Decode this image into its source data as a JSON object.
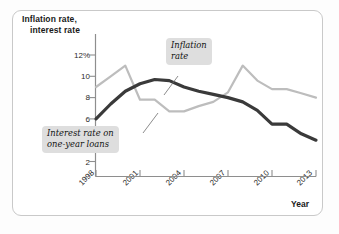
{
  "figure": {
    "type": "line-chart-figure",
    "background": "#ffffff",
    "border_color": "#c9c9c9"
  },
  "axes": {
    "y_title_line1": "Inflation rate,",
    "y_title_line2": "interest rate",
    "x_title": "Year",
    "y_ticks": [
      "12%",
      "10",
      "8",
      "6",
      "4",
      "2"
    ],
    "x_ticks": [
      "1998",
      "2001",
      "2004",
      "2007",
      "2010",
      "2013"
    ]
  },
  "callouts": [
    {
      "name": "inflation-rate-callout",
      "line1": "Inflation",
      "line2": "rate",
      "bg": "#dedede"
    },
    {
      "name": "interest-rate-callout",
      "line1": "Interest rate on",
      "line2": "one-year loans",
      "bg": "#dedede"
    }
  ],
  "chart_data": {
    "type": "line",
    "title": "",
    "xlabel": "Year",
    "ylabel": "Inflation rate, interest rate",
    "xlim": [
      1998,
      2013
    ],
    "ylim": [
      0,
      13
    ],
    "ytick_values": [
      2,
      4,
      6,
      8,
      10,
      12
    ],
    "ytick_labels": [
      "2",
      "4",
      "6",
      "8",
      "10",
      "12%"
    ],
    "xtick_values": [
      1998,
      2001,
      2004,
      2007,
      2010,
      2013
    ],
    "xtick_labels": [
      "1998",
      "2001",
      "2004",
      "2007",
      "2010",
      "2013"
    ],
    "grid": false,
    "legend": "callout-annotations",
    "x": [
      1998,
      1999,
      2000,
      2001,
      2002,
      2003,
      2004,
      2005,
      2006,
      2007,
      2008,
      2009,
      2010,
      2011,
      2012,
      2013
    ],
    "series": [
      {
        "name": "Inflation rate",
        "color": "#bdbdbd",
        "width": 2.2,
        "values": [
          9.0,
          10.0,
          11.0,
          7.8,
          7.8,
          6.7,
          6.7,
          7.2,
          7.6,
          8.5,
          11.0,
          9.6,
          8.8,
          8.8,
          8.4,
          8.0
        ]
      },
      {
        "name": "Interest rate on one-year loans",
        "color": "#3a3a3a",
        "width": 3.2,
        "values": [
          6.0,
          7.4,
          8.6,
          9.3,
          9.7,
          9.6,
          9.0,
          8.6,
          8.3,
          8.0,
          7.6,
          6.8,
          5.5,
          5.5,
          4.6,
          4.0
        ]
      }
    ]
  }
}
